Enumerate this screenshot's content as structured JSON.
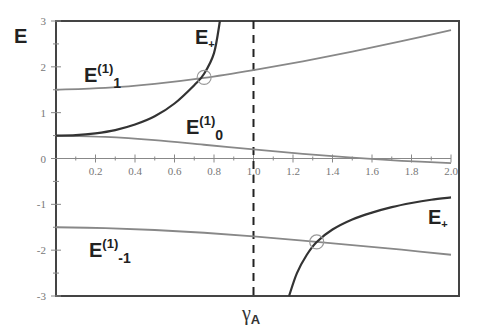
{
  "chart_data": {
    "type": "line",
    "title": "",
    "xlabel": "γA",
    "ylabel": "E",
    "xlim": [
      0,
      2.0
    ],
    "ylim": [
      -3,
      3
    ],
    "grid": false,
    "legend": "inline labels",
    "x_ticks": [
      "0.2",
      "0.4",
      "0.6",
      "0.8",
      "1.0",
      "1.2",
      "1.4",
      "1.6",
      "1.8",
      "2.0"
    ],
    "y_ticks": [
      "3",
      "2",
      "1",
      "0",
      "-1",
      "-2",
      "-3"
    ],
    "vertical_dashed_line": {
      "x": 1.0
    },
    "series": [
      {
        "name": "E(1)1",
        "label_main": "E",
        "label_sup": "(1)",
        "label_sub": "1",
        "color": "#888888",
        "x": [
          0,
          0.25,
          0.5,
          0.75,
          1.0,
          1.25,
          1.5,
          1.75,
          2.0
        ],
        "y": [
          1.5,
          1.54,
          1.63,
          1.76,
          1.93,
          2.12,
          2.33,
          2.56,
          2.8
        ]
      },
      {
        "name": "E(1)0",
        "label_main": "E",
        "label_sup": "(1)",
        "label_sub": "0",
        "color": "#888888",
        "x": [
          0,
          0.25,
          0.5,
          0.75,
          1.0,
          1.25,
          1.5,
          1.75,
          2.0
        ],
        "y": [
          0.5,
          0.47,
          0.4,
          0.3,
          0.2,
          0.1,
          0.02,
          -0.05,
          -0.1
        ]
      },
      {
        "name": "E(1)-1",
        "label_main": "E",
        "label_sup": "(1)",
        "label_sub": "-1",
        "color": "#888888",
        "x": [
          0,
          0.25,
          0.5,
          0.75,
          1.0,
          1.25,
          1.5,
          1.75,
          2.0
        ],
        "y": [
          -1.5,
          -1.52,
          -1.56,
          -1.62,
          -1.7,
          -1.79,
          -1.89,
          -1.99,
          -2.1
        ]
      },
      {
        "name": "E+ (upper branch)",
        "label_main": "E",
        "label_sub": "+",
        "color": "#333333",
        "x": [
          0,
          0.1,
          0.2,
          0.3,
          0.4,
          0.5,
          0.6,
          0.7,
          0.75,
          0.8,
          0.83
        ],
        "y": [
          0.5,
          0.51,
          0.55,
          0.62,
          0.74,
          0.92,
          1.2,
          1.6,
          1.85,
          2.3,
          3.0
        ]
      },
      {
        "name": "E+ (lower branch)",
        "label_main": "E",
        "label_sub": "+",
        "color": "#333333",
        "x": [
          1.18,
          1.22,
          1.27,
          1.32,
          1.4,
          1.5,
          1.6,
          1.7,
          1.8,
          1.9,
          2.0
        ],
        "y": [
          -3.0,
          -2.5,
          -2.1,
          -1.82,
          -1.55,
          -1.33,
          -1.18,
          -1.06,
          -0.97,
          -0.9,
          -0.85
        ]
      }
    ],
    "annotations": [
      {
        "type": "circle",
        "x": 0.75,
        "y": 1.77,
        "note": "crossing of E+ and E(1)1"
      },
      {
        "type": "circle",
        "x": 1.32,
        "y": -1.82,
        "note": "crossing of E+ and E(1)-1"
      }
    ]
  },
  "labels": {
    "y_axis": "E",
    "x_axis_main": "γ",
    "x_axis_sub": "A",
    "e_main": "E",
    "sup": "(1)",
    "sub_1": "1",
    "sub_0": "0",
    "sub_m1": "-1",
    "plus": "+"
  },
  "ticks": {
    "x": [
      "0.2",
      "0.4",
      "0.6",
      "0.8",
      "1.0",
      "1.2",
      "1.4",
      "1.6",
      "1.8",
      "2.0"
    ],
    "y": [
      "3",
      "2",
      "1",
      "0",
      "-1",
      "-2",
      "-3"
    ]
  }
}
